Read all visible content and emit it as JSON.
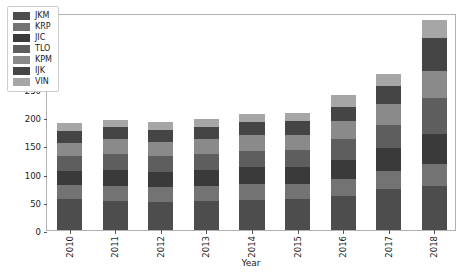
{
  "chart_data": {
    "type": "bar",
    "stacked": true,
    "title": "",
    "xlabel": "Year",
    "ylabel": "",
    "categories": [
      "2010",
      "2011",
      "2012",
      "2013",
      "2014",
      "2015",
      "2016",
      "2017",
      "2018"
    ],
    "ylim": [
      0,
      385
    ],
    "yticks": [
      0,
      50,
      100,
      150,
      200,
      250,
      300,
      350
    ],
    "ytick_labels": [
      "0",
      "50",
      "100",
      "150",
      "200",
      "250",
      "300",
      "350"
    ],
    "grid": false,
    "legend_position": "upper left",
    "series": [
      {
        "name": "JKM",
        "color": "#4d4d4d",
        "values": [
          55,
          52,
          50,
          52,
          54,
          55,
          60,
          72,
          78
        ]
      },
      {
        "name": "KRP",
        "color": "#737373",
        "values": [
          24,
          27,
          26,
          26,
          28,
          26,
          31,
          33,
          40
        ]
      },
      {
        "name": "JIC",
        "color": "#3a3a3a",
        "values": [
          26,
          28,
          27,
          28,
          29,
          30,
          34,
          40,
          52
        ]
      },
      {
        "name": "TLO",
        "color": "#5e5e5e",
        "values": [
          27,
          28,
          28,
          29,
          30,
          31,
          36,
          42,
          64
        ]
      },
      {
        "name": "KPM",
        "color": "#8a8a8a",
        "values": [
          23,
          26,
          25,
          26,
          27,
          27,
          32,
          37,
          48
        ]
      },
      {
        "name": "IJK",
        "color": "#454545",
        "values": [
          20,
          21,
          22,
          22,
          23,
          24,
          26,
          31,
          58
        ]
      },
      {
        "name": "VIN",
        "color": "#a6a6a6",
        "values": [
          15,
          14,
          14,
          14,
          15,
          15,
          21,
          22,
          32
        ]
      }
    ],
    "totals": [
      190,
      196,
      192,
      197,
      206,
      208,
      240,
      277,
      372
    ]
  },
  "axis": {
    "xlabel": "Year",
    "frame_color": "#b0b0b0",
    "tick_color": "#555555",
    "text_color": "#1a1a1a"
  },
  "legend": {
    "entries": [
      "JKM",
      "KRP",
      "JIC",
      "TLO",
      "KPM",
      "IJK",
      "VIN"
    ]
  }
}
